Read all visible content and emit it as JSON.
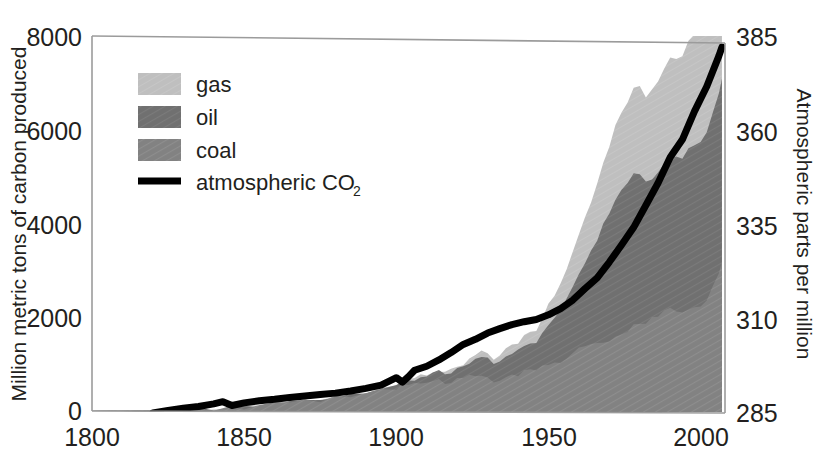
{
  "chart_data": {
    "type": "area",
    "title": "",
    "subtitle": "",
    "xlabel": "",
    "ylabel": "Million metric tons of carbon produced",
    "y2label": "Atmospheric parts per million",
    "xlim": [
      1800,
      2008
    ],
    "ylim": [
      0,
      8000
    ],
    "y2lim": [
      285,
      385
    ],
    "grid": false,
    "legend_position": "upper-left",
    "stacked": true,
    "x_ticks": [
      "1800",
      "1850",
      "1900",
      "1950",
      "2000"
    ],
    "x_tick_values": [
      1800,
      1850,
      1900,
      1950,
      2000
    ],
    "y_ticks": [
      "0",
      "2000",
      "4000",
      "6000",
      "8000"
    ],
    "y_tick_values": [
      0,
      2000,
      4000,
      6000,
      8000
    ],
    "y2_ticks": [
      "285",
      "310",
      "335",
      "360",
      "385"
    ],
    "y2_tick_values": [
      285,
      310,
      335,
      360,
      385
    ],
    "colors": {
      "gas": "#bfbfbf",
      "oil": "#707070",
      "coal": "#828282",
      "co2_line": "#000000",
      "frame": "#9b9b9b",
      "text": "#231f20",
      "background": "#ffffff"
    },
    "legend": [
      {
        "label": "gas",
        "swatch": "#bfbfbf",
        "kind": "area"
      },
      {
        "label": "oil",
        "swatch": "#707070",
        "kind": "area"
      },
      {
        "label": "coal",
        "swatch": "#828282",
        "kind": "area"
      },
      {
        "label": "atmospheric CO",
        "sub": "2",
        "swatch": "#000000",
        "kind": "line"
      }
    ],
    "x": [
      1800,
      1805,
      1810,
      1815,
      1820,
      1825,
      1830,
      1835,
      1840,
      1845,
      1850,
      1855,
      1860,
      1865,
      1870,
      1875,
      1880,
      1885,
      1890,
      1895,
      1900,
      1902,
      1904,
      1906,
      1908,
      1910,
      1912,
      1914,
      1916,
      1918,
      1920,
      1922,
      1924,
      1926,
      1928,
      1930,
      1932,
      1934,
      1936,
      1938,
      1940,
      1942,
      1944,
      1946,
      1948,
      1950,
      1952,
      1954,
      1956,
      1958,
      1960,
      1962,
      1964,
      1966,
      1968,
      1970,
      1972,
      1974,
      1976,
      1978,
      1980,
      1982,
      1984,
      1986,
      1988,
      1990,
      1992,
      1994,
      1996,
      1998,
      2000,
      2002,
      2004,
      2006,
      2007
    ],
    "series": [
      {
        "name": "coal",
        "values": [
          8,
          12,
          15,
          20,
          25,
          30,
          38,
          48,
          58,
          70,
          90,
          115,
          145,
          180,
          215,
          250,
          295,
          340,
          390,
          450,
          510,
          545,
          575,
          600,
          625,
          650,
          690,
          700,
          660,
          680,
          720,
          700,
          760,
          800,
          820,
          760,
          640,
          700,
          790,
          800,
          830,
          900,
          950,
          900,
          980,
          1050,
          1080,
          1100,
          1200,
          1250,
          1350,
          1400,
          1450,
          1500,
          1550,
          1580,
          1620,
          1680,
          1780,
          1850,
          1900,
          1950,
          2050,
          2100,
          2200,
          2250,
          2200,
          2180,
          2250,
          2280,
          2350,
          2450,
          2700,
          3050,
          3300
        ]
      },
      {
        "name": "oil",
        "values": [
          0,
          0,
          0,
          0,
          0,
          0,
          0,
          0,
          0,
          0,
          0,
          0,
          2,
          5,
          10,
          14,
          20,
          28,
          38,
          50,
          65,
          75,
          85,
          95,
          110,
          125,
          145,
          165,
          175,
          190,
          220,
          250,
          290,
          330,
          370,
          390,
          370,
          400,
          450,
          470,
          500,
          520,
          560,
          620,
          740,
          860,
          980,
          1100,
          1300,
          1450,
          1650,
          1850,
          2050,
          2250,
          2500,
          2750,
          3000,
          3150,
          3200,
          3350,
          3250,
          3050,
          3000,
          3100,
          3200,
          3250,
          3300,
          3350,
          3450,
          3500,
          3550,
          3600,
          3750,
          3900,
          3950
        ]
      },
      {
        "name": "gas",
        "values": [
          0,
          0,
          0,
          0,
          0,
          0,
          0,
          0,
          0,
          0,
          0,
          0,
          0,
          0,
          0,
          0,
          0,
          0,
          2,
          5,
          10,
          13,
          16,
          20,
          25,
          30,
          38,
          45,
          50,
          58,
          70,
          80,
          95,
          110,
          125,
          135,
          125,
          140,
          160,
          175,
          195,
          215,
          250,
          290,
          340,
          400,
          470,
          540,
          630,
          720,
          830,
          930,
          1040,
          1160,
          1290,
          1420,
          1550,
          1650,
          1720,
          1830,
          1880,
          1850,
          1920,
          1980,
          2060,
          2130,
          2150,
          2200,
          2300,
          2350,
          2400,
          2450,
          2550,
          2650,
          2700
        ]
      }
    ],
    "co2": {
      "name": "atmospheric CO2",
      "unit": "ppm",
      "x": [
        1820,
        1825,
        1830,
        1835,
        1840,
        1843,
        1846,
        1850,
        1855,
        1860,
        1865,
        1870,
        1875,
        1880,
        1885,
        1890,
        1895,
        1900,
        1902,
        1904,
        1906,
        1910,
        1914,
        1918,
        1922,
        1926,
        1930,
        1934,
        1938,
        1942,
        1946,
        1950,
        1954,
        1958,
        1962,
        1966,
        1970,
        1974,
        1978,
        1982,
        1986,
        1990,
        1994,
        1998,
        2002,
        2006,
        2007
      ],
      "values": [
        284.5,
        285.2,
        285.8,
        286.3,
        287.0,
        287.6,
        286.6,
        287.3,
        287.9,
        288.3,
        288.8,
        289.2,
        289.6,
        290.0,
        290.6,
        291.3,
        292.2,
        294.2,
        293.0,
        294.5,
        296.2,
        297.3,
        299.0,
        301.0,
        303.2,
        304.6,
        306.3,
        307.5,
        308.6,
        309.4,
        310.0,
        311.3,
        313.0,
        315.3,
        318.4,
        321.3,
        325.6,
        330.2,
        335.0,
        341.0,
        347.0,
        354.0,
        358.8,
        366.5,
        373.2,
        381.5,
        383.9
      ]
    }
  },
  "axes": {
    "left": {
      "title": "Million metric tons of carbon produced",
      "ticks": [
        "8000",
        "6000",
        "4000",
        "2000",
        "0"
      ]
    },
    "right": {
      "title": "Atmospheric parts per million",
      "ticks": [
        "385",
        "360",
        "335",
        "310",
        "285"
      ]
    },
    "bottom": {
      "ticks": [
        "1800",
        "1850",
        "1900",
        "1950",
        "2000"
      ]
    }
  },
  "legend": {
    "gas_label": "gas",
    "oil_label": "oil",
    "coal_label": "coal",
    "co2_label": "atmospheric CO",
    "co2_sub": "2"
  }
}
